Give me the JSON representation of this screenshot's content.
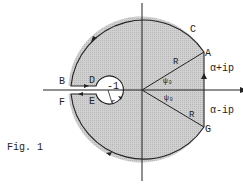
{
  "figure": {
    "caption": "Fig. 1",
    "labels": {
      "A": "A",
      "B": "B",
      "C": "C",
      "D": "D",
      "E": "E",
      "F": "F",
      "G": "G",
      "minus_one": "-1",
      "r": "r",
      "R_upper": "R",
      "R_lower": "R",
      "psi_upper": "ψ₀",
      "psi_lower": "ψ₀",
      "alpha_plus": "α+ip",
      "alpha_minus": "α-ip"
    },
    "colors": {
      "fill": "#c8c8c8",
      "stroke": "#222222"
    }
  }
}
